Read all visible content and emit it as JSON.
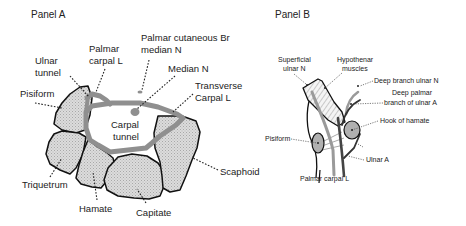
{
  "panel_a": {
    "title": "Panel A",
    "labels": {
      "palmar_cutaneous_1": "Palmar cutaneous Br",
      "palmar_cutaneous_2": "median N",
      "palmar_carpal_1": "Palmar",
      "palmar_carpal_2": "carpal L",
      "ulnar_tunnel_1": "Ulnar",
      "ulnar_tunnel_2": "tunnel",
      "median_n": "Median N",
      "transverse_1": "Transverse",
      "transverse_2": "Carpal L",
      "pisiform": "Pisiform",
      "carpal_tunnel_1": "Carpal",
      "carpal_tunnel_2": "tunnel",
      "scaphoid": "Scaphoid",
      "triquetrum": "Triquetrum",
      "hamate": "Hamate",
      "capitate": "Capitate"
    }
  },
  "panel_b": {
    "title": "Panel B",
    "labels": {
      "superficial_ulnar_1": "Superficial",
      "superficial_ulnar_2": "ulnar N",
      "hypothenar_1": "Hypothenar",
      "hypothenar_2": "muscles",
      "deep_branch_ulnar_n": "Deep branch ulnar N",
      "deep_palmar_1": "Deep palmar",
      "deep_palmar_2": "branch of ulnar A",
      "hook_of_hamate": "Hook of hamate",
      "pisiform": "Pisiform",
      "ulnar_a": "Ulnar A",
      "palmar_carpal_l": "Palmar carpal L"
    }
  },
  "colors": {
    "ligament_gray": "#8f8f8f",
    "bone_fill": "#d9d9d9",
    "outline": "#111111"
  }
}
